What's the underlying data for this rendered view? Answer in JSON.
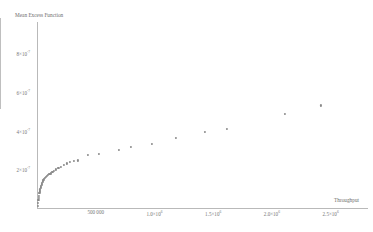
{
  "chart_data": {
    "type": "scatter",
    "title": "",
    "xlabel": "Throughput",
    "ylabel": "Mean Excess Function",
    "xlim": [
      0,
      2750000
    ],
    "ylim": [
      0,
      9.4e-07
    ],
    "grid": false,
    "legend": null,
    "marker_color": "#8a8a8a",
    "axis_color": "#b9b9b9",
    "xticks": [
      {
        "value": 500000,
        "label": "500 000"
      },
      {
        "value": 1000000,
        "label": "1.0×10",
        "exp": "6"
      },
      {
        "value": 1500000,
        "label": "1.5×10",
        "exp": "6"
      },
      {
        "value": 2000000,
        "label": "2.0×10",
        "exp": "6"
      },
      {
        "value": 2500000,
        "label": "2.5×10",
        "exp": "6"
      }
    ],
    "yticks": [
      {
        "value": 2e-07,
        "label": "2×10",
        "exp": "-7"
      },
      {
        "value": 4e-07,
        "label": "4×10",
        "exp": "-7"
      },
      {
        "value": 6e-07,
        "label": "6×10",
        "exp": "-7"
      },
      {
        "value": 8e-07,
        "label": "8×10",
        "exp": "-7"
      }
    ],
    "points": [
      {
        "x": 6000,
        "y": 1e-08
      },
      {
        "x": 9000,
        "y": 2.6e-08
      },
      {
        "x": 12000,
        "y": 4e-08
      },
      {
        "x": 15000,
        "y": 5.2e-08
      },
      {
        "x": 18000,
        "y": 6.4e-08
      },
      {
        "x": 21000,
        "y": 7.6e-08
      },
      {
        "x": 24000,
        "y": 8.6e-08
      },
      {
        "x": 27000,
        "y": 9.6e-08
      },
      {
        "x": 31000,
        "y": 1.06e-07
      },
      {
        "x": 35000,
        "y": 1.14e-07
      },
      {
        "x": 39000,
        "y": 1.22e-07
      },
      {
        "x": 44000,
        "y": 1.3e-07
      },
      {
        "x": 49000,
        "y": 1.37e-07
      },
      {
        "x": 55000,
        "y": 1.44e-07
      },
      {
        "x": 61000,
        "y": 1.5e-07
      },
      {
        "x": 68000,
        "y": 1.56e-07
      },
      {
        "x": 76000,
        "y": 1.61e-07
      },
      {
        "x": 85000,
        "y": 1.66e-07
      },
      {
        "x": 95000,
        "y": 1.7e-07
      },
      {
        "x": 106000,
        "y": 1.74e-07
      },
      {
        "x": 118000,
        "y": 1.79e-07
      },
      {
        "x": 131000,
        "y": 1.85e-07
      },
      {
        "x": 146000,
        "y": 1.92e-07
      },
      {
        "x": 163000,
        "y": 1.99e-07
      },
      {
        "x": 182000,
        "y": 2.06e-07
      },
      {
        "x": 203000,
        "y": 2.13e-07
      },
      {
        "x": 226000,
        "y": 2.21e-07
      },
      {
        "x": 252000,
        "y": 2.3e-07
      },
      {
        "x": 281000,
        "y": 2.4e-07
      },
      {
        "x": 313000,
        "y": 2.42e-07
      },
      {
        "x": 349000,
        "y": 2.46e-07
      },
      {
        "x": 430000,
        "y": 2.74e-07
      },
      {
        "x": 530000,
        "y": 2.8e-07
      },
      {
        "x": 700000,
        "y": 3.02e-07
      },
      {
        "x": 800000,
        "y": 3.16e-07
      },
      {
        "x": 980000,
        "y": 3.3e-07
      },
      {
        "x": 1180000,
        "y": 3.62e-07
      },
      {
        "x": 1430000,
        "y": 3.95e-07
      },
      {
        "x": 1620000,
        "y": 4.1e-07
      },
      {
        "x": 2110000,
        "y": 4.88e-07
      },
      {
        "x": 2420000,
        "y": 5.3e-07
      }
    ]
  }
}
